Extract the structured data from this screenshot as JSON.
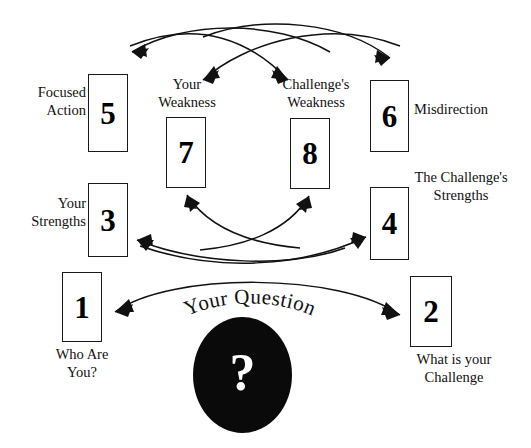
{
  "diagram": {
    "background_color": "#ffffff",
    "ink_color": "#111111",
    "center": {
      "glyph": "?",
      "glyph_name": "question-mark",
      "caption": "Your Question",
      "shape": "oval",
      "fill_color": "#0a0a0a",
      "glyph_color": "#ffffff"
    },
    "cards": [
      {
        "id": "card-1",
        "number": "1",
        "label": "Who Are\nYou?",
        "label_position": "below"
      },
      {
        "id": "card-2",
        "number": "2",
        "label": "What is your\nChallenge",
        "label_position": "below"
      },
      {
        "id": "card-3",
        "number": "3",
        "label": "Your\nStrengths",
        "label_position": "left"
      },
      {
        "id": "card-4",
        "number": "4",
        "label": "The Challenge's\nStrengths",
        "label_position": "above-right"
      },
      {
        "id": "card-5",
        "number": "5",
        "label": "Focused\nAction",
        "label_position": "left"
      },
      {
        "id": "card-6",
        "number": "6",
        "label": "Misdirection",
        "label_position": "right"
      },
      {
        "id": "card-7",
        "number": "7",
        "label": "Your\nWeakness",
        "label_position": "above"
      },
      {
        "id": "card-8",
        "number": "8",
        "label": "Challenge's\nWeakness",
        "label_position": "above"
      }
    ],
    "connectors": [
      {
        "name": "arc-1-to-2",
        "from": "card-1",
        "to": "card-2",
        "style": "double-headed-arc",
        "direction": "bidirectional"
      },
      {
        "name": "arc-4-to-3",
        "from": "card-4",
        "to": "card-3",
        "style": "arc",
        "direction": "leftward"
      },
      {
        "name": "arc-3-to-4",
        "from": "card-3",
        "to": "card-4",
        "style": "arc",
        "direction": "rightward"
      },
      {
        "name": "arc-to-7",
        "from": "lower-right",
        "to": "card-7",
        "style": "arc",
        "direction": "up-left"
      },
      {
        "name": "arc-to-8",
        "from": "lower-left",
        "to": "card-8",
        "style": "arc",
        "direction": "up-right"
      },
      {
        "name": "arc-to-5",
        "from": "upper-right",
        "to": "card-5",
        "style": "arc",
        "direction": "down-left"
      },
      {
        "name": "arc-to-7-top",
        "from": "upper-right",
        "to": "card-7",
        "style": "arc",
        "direction": "down-left"
      },
      {
        "name": "arc-to-8-top",
        "from": "upper-left",
        "to": "card-8",
        "style": "arc",
        "direction": "down-right"
      },
      {
        "name": "arc-to-6",
        "from": "upper-left",
        "to": "card-6",
        "style": "arc",
        "direction": "down-right"
      }
    ]
  }
}
